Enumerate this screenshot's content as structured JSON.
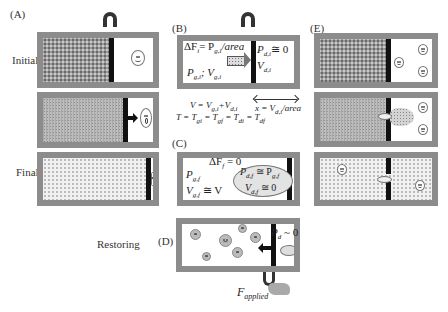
{
  "panels": {
    "A": {
      "label": "(A)"
    },
    "B": {
      "label": "(B)"
    },
    "C": {
      "label": "(C)"
    },
    "D": {
      "label": "(D)"
    },
    "E": {
      "label": "(E)"
    }
  },
  "row_labels": {
    "initial": "Initial",
    "final": "Final",
    "restoring": "Restoring"
  },
  "panel_B": {
    "delta_f": "ΔF",
    "delta_f_sub": "i",
    "eq_pg": "= P",
    "pg_sub": "g,i",
    "per_area": "/area",
    "pg_label": "P",
    "pgi_sub": "g,i",
    "semicolon_v": "; V",
    "vgi_sub": "g,i",
    "pd_label": "P",
    "pdi_sub": "d,i",
    "pdi_val": "≅ 0",
    "vd_label": "V",
    "vdi_sub": "d,i"
  },
  "equations": {
    "volume": {
      "lhs": "V = V",
      "s1": "g,i",
      "plus": "+V",
      "s2": "d,i"
    },
    "displacement": {
      "lhs": "x = V",
      "s1": "d,i",
      "rest": "/area"
    },
    "temperature": {
      "t": "T = T",
      "s1": "gi",
      "e2": " = T",
      "s2": "gf",
      "e3": " = T",
      "s3": "di",
      "e4": " = T",
      "s4": "df"
    }
  },
  "panel_C": {
    "delta_f": "ΔF",
    "delta_f_sub": "f",
    "delta_f_val": " = 0",
    "pg": "P",
    "pgf_sub": "g,f",
    "vg": "V",
    "vgf_sub": "g,f",
    "vg_val": " ≅ V",
    "pd": "P",
    "pdf_sub": "d,f",
    "pd_eq": " ≅ P",
    "pgf2_sub": "g,f",
    "vd": "V",
    "vdf_sub": "d,f",
    "vd_val": " ≅ 0"
  },
  "panel_D": {
    "pd": "P",
    "pd_sub": "d",
    "pd_val": " ~ 0",
    "force": "F",
    "force_sub": "applied"
  },
  "icons": {
    "magnet": "horseshoe-magnet",
    "smiley": "smiley-face",
    "sad": "sad-face",
    "hand": "pulling-hand"
  },
  "colors": {
    "box_frame": "#8c8c8c",
    "piston": "#111111",
    "gas_dense": "#9a9a9a",
    "gas_light": "#f1f1f1"
  }
}
